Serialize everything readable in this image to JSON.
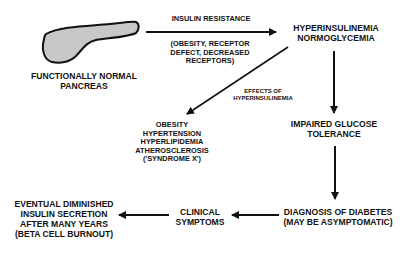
{
  "diagram": {
    "nodes": {
      "pancreas": {
        "lines": [
          "FUNCTIONALLY NORMAL",
          "PANCREAS"
        ]
      },
      "hyper": {
        "lines": [
          "HYPERINSULINEMIA",
          "NORMOGLYCEMIA"
        ]
      },
      "impaired": {
        "lines": [
          "IMPAIRED GLUCOSE",
          "TOLERANCE"
        ]
      },
      "diagnosis": {
        "lines": [
          "DIAGNOSIS OF DIABETES",
          "(MAY BE ASYMPTOMATIC)"
        ]
      },
      "clinical": {
        "lines": [
          "CLINICAL",
          "SYMPTOMS"
        ]
      },
      "eventual": {
        "lines": [
          "EVENTUAL DIMINISHED",
          "INSULIN SECRETION",
          "AFTER MANY YEARS",
          "(BETA CELL BURNOUT)"
        ]
      },
      "syndrome": {
        "lines": [
          "OBESITY",
          "HYPERTENSION",
          "HYPERLIPIDEMIA",
          "ATHEROSCLEROSIS",
          "('SYNDROME X')"
        ]
      }
    },
    "edge_labels": {
      "insulin_resistance": "INSULIN RESISTANCE",
      "causes": [
        "(OBESITY, RECEPTOR",
        "DEFECT, DECREASED",
        "RECEPTORS)"
      ],
      "effects": [
        "EFFECTS OF",
        "HYPERINSULINEMIA"
      ]
    },
    "colors": {
      "ink": "#111111",
      "pancreas_fill": "#c8c8c8"
    }
  }
}
